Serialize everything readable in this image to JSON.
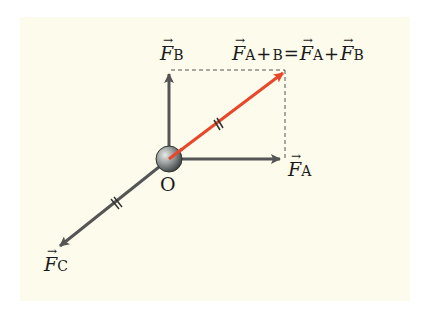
{
  "diagram": {
    "origin_label": "O",
    "vectors": [
      {
        "name": "F_A",
        "symbol": "F",
        "subscript": "A",
        "color": "#555555",
        "from": [
          169,
          159
        ],
        "to": [
          282,
          159
        ]
      },
      {
        "name": "F_B",
        "symbol": "F",
        "subscript": "B",
        "color": "#555555",
        "from": [
          169,
          159
        ],
        "to": [
          169,
          70
        ]
      },
      {
        "name": "F_C",
        "symbol": "F",
        "subscript": "C",
        "color": "#555555",
        "from": [
          169,
          159
        ],
        "to": [
          57,
          248
        ]
      },
      {
        "name": "F_A+B",
        "symbol": "F",
        "subscript": "A+B",
        "color": "#e8472a",
        "from": [
          169,
          159
        ],
        "to": [
          285,
          72
        ]
      }
    ],
    "resultant_equation": {
      "lhs_symbol": "F",
      "lhs_subscript": "A+B",
      "equals": "=",
      "term1_symbol": "F",
      "term1_subscript": "A",
      "plus": "+",
      "term2_symbol": "F",
      "term2_subscript": "B"
    },
    "labels": {
      "fa_symbol": "F",
      "fa_sub": "A",
      "fb_symbol": "F",
      "fb_sub": "B",
      "fc_symbol": "F",
      "fc_sub": "C"
    },
    "annotations": [
      "dashed parallelogram lines",
      "double tick marks on F_A+B and F_C indicating equal magnitude"
    ],
    "colors": {
      "background": "#fdfbeb",
      "force": "#555555",
      "resultant": "#e8472a"
    }
  }
}
